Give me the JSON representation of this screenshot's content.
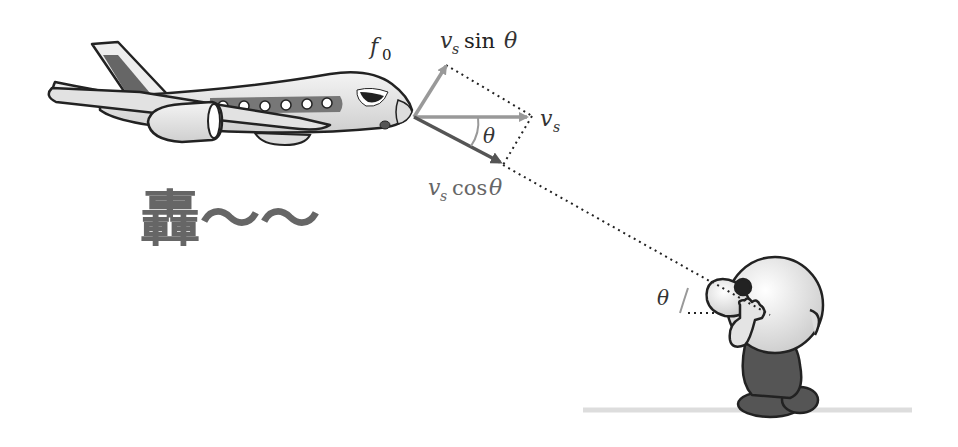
{
  "diagram": {
    "labels": {
      "source_frequency": "f",
      "source_frequency_sub": "0",
      "velocity": "v",
      "velocity_sub": "s",
      "sin_component_fn": "sin",
      "cos_component_fn": "cos",
      "theta": "θ",
      "observer_angle": "θ",
      "sound_text": "轟〜〜"
    },
    "vectors": [
      {
        "name": "v_s",
        "direction": "horizontal",
        "color": "#999999"
      },
      {
        "name": "v_s sin θ",
        "direction": "perpendicular-up",
        "color": "#999999"
      },
      {
        "name": "v_s cos θ",
        "direction": "toward-observer",
        "color": "#555555"
      }
    ],
    "colors": {
      "gray_arrow": "#999999",
      "dark_arrow": "#555555",
      "line": "#222222",
      "observer_body": "#555555",
      "observer_head": "#eeeeee",
      "ground": "#dddddd"
    }
  }
}
